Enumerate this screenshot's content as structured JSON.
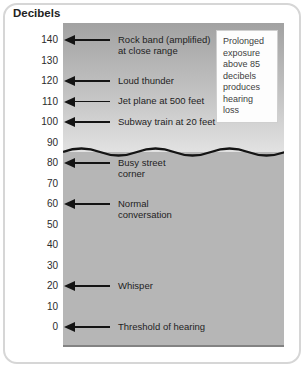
{
  "page": {
    "title": "Decibels"
  },
  "callout": {
    "text": "Prolonged exposure above 85 decibels produces hearing loss"
  },
  "scale": {
    "unit": "Decibels",
    "ticks": [
      {
        "value": 140,
        "label": "Rock band (amplified)\nat close range"
      },
      {
        "value": 130,
        "label": ""
      },
      {
        "value": 120,
        "label": "Loud thunder"
      },
      {
        "value": 110,
        "label": "Jet plane at 500 feet"
      },
      {
        "value": 100,
        "label": "Subway train at 20 feet"
      },
      {
        "value": 90,
        "label": ""
      },
      {
        "value": 80,
        "label": "Busy street\ncorner"
      },
      {
        "value": 70,
        "label": ""
      },
      {
        "value": 60,
        "label": "Normal\nconversation"
      },
      {
        "value": 50,
        "label": ""
      },
      {
        "value": 40,
        "label": ""
      },
      {
        "value": 30,
        "label": ""
      },
      {
        "value": 20,
        "label": "Whisper"
      },
      {
        "value": 10,
        "label": ""
      },
      {
        "value": 0,
        "label": "Threshold of hearing"
      }
    ],
    "wavy_line_decibels": 85
  },
  "colors": {
    "panel_gradient_top": "#a2a2a2",
    "panel_gradient_bottom": "#e2e2e2",
    "panel_lower": "#b6b6b6",
    "line_and_text": "#141414",
    "card_border": "#d6d6d6",
    "callout_background": "#fdfdfd"
  },
  "chart_data": {
    "type": "scatter",
    "title": "Decibels",
    "ylabel": "Decibels",
    "ylim": [
      0,
      140
    ],
    "y_ticks": [
      140,
      130,
      120,
      110,
      100,
      90,
      80,
      70,
      60,
      50,
      40,
      30,
      20,
      10,
      0
    ],
    "grid": false,
    "legend_position": "none",
    "points": [
      {
        "label": "Rock band (amplified) at close range",
        "decibels": 140
      },
      {
        "label": "Loud thunder",
        "decibels": 120
      },
      {
        "label": "Jet plane at 500 feet",
        "decibels": 110
      },
      {
        "label": "Subway train at 20 feet",
        "decibels": 100
      },
      {
        "label": "Busy street corner",
        "decibels": 80
      },
      {
        "label": "Normal conversation",
        "decibels": 60
      },
      {
        "label": "Whisper",
        "decibels": 20
      },
      {
        "label": "Threshold of hearing",
        "decibels": 0
      }
    ],
    "annotations": [
      {
        "text": "Prolonged exposure above 85 decibels produces hearing loss",
        "position": "top-right"
      },
      {
        "text": "Wavy divider line drawn at approximately 85 decibels",
        "position": "y=85"
      }
    ]
  }
}
